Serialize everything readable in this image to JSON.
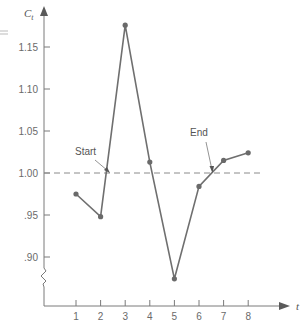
{
  "chart_data": {
    "type": "line",
    "title": "",
    "xlabel": "t",
    "ylabel": "C_t",
    "ylabel_main": "C",
    "ylabel_sub": "t",
    "x": [
      1,
      2,
      3,
      4,
      5,
      6,
      7,
      8
    ],
    "series": [
      {
        "name": "C_t",
        "values": [
          0.975,
          0.948,
          1.176,
          1.013,
          0.874,
          0.984,
          1.015,
          1.024
        ]
      }
    ],
    "reference_line": {
      "y": 1.0,
      "style": "dashed"
    },
    "annotations": [
      {
        "text": "Start",
        "points_to_x": 2.55
      },
      {
        "text": "End",
        "points_to_x": 6.6
      }
    ],
    "xticks": [
      "1",
      "2",
      "3",
      "4",
      "5",
      "6",
      "7",
      "8"
    ],
    "yticks": [
      "1.15",
      "1.10",
      "1.05",
      "1.00",
      ".95",
      ".90"
    ],
    "ylim": [
      0.85,
      1.18
    ],
    "axis_break": true,
    "grid": false,
    "legend": null
  },
  "colors": {
    "line": "#6f6f6f",
    "axis": "#7a7a7a",
    "dashed": "#8a8a8a"
  }
}
